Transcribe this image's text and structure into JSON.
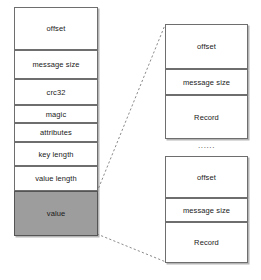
{
  "diagram": {
    "colors": {
      "box_border": "#6e6e6e",
      "box_fill": "#ffffff",
      "shaded_fill": "#9d9d9d",
      "connector": "#8a8a8a",
      "text": "#1a1a1a"
    },
    "message_stack": {
      "name": "message",
      "fields": [
        {
          "label": "offset",
          "shaded": false,
          "top": 0,
          "height": 43
        },
        {
          "label": "message size",
          "shaded": false,
          "top": 43,
          "height": 29
        },
        {
          "label": "crc32",
          "shaded": false,
          "top": 72,
          "height": 26
        },
        {
          "label": "magic",
          "shaded": false,
          "top": 98,
          "height": 18
        },
        {
          "label": "attributes",
          "shaded": false,
          "top": 116,
          "height": 19
        },
        {
          "label": "key length",
          "shaded": false,
          "top": 135,
          "height": 24
        },
        {
          "label": "value length",
          "shaded": false,
          "top": 159,
          "height": 25
        },
        {
          "label": "value",
          "shaded": true,
          "top": 184,
          "height": 45
        }
      ]
    },
    "record_groups": [
      {
        "name": "log-entry-1",
        "fields": [
          {
            "label": "offset",
            "top": 0,
            "height": 45
          },
          {
            "label": "message size",
            "top": 45,
            "height": 26
          },
          {
            "label": "Record",
            "top": 71,
            "height": 44
          }
        ]
      },
      {
        "name": "log-entry-2",
        "fields": [
          {
            "label": "offset",
            "top": 0,
            "height": 42
          },
          {
            "label": "message size",
            "top": 42,
            "height": 24
          },
          {
            "label": "Record",
            "top": 66,
            "height": 41
          }
        ]
      }
    ],
    "ellipsis": "......",
    "connectors": [
      {
        "name": "upper-expansion-line",
        "x1": 97,
        "y1": 192,
        "x2": 165,
        "y2": 25
      },
      {
        "name": "lower-expansion-line",
        "x1": 97,
        "y1": 234,
        "x2": 166,
        "y2": 262
      }
    ]
  }
}
